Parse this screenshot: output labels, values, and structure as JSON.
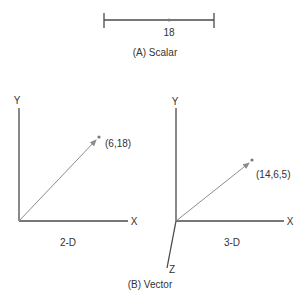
{
  "colors": {
    "axis": "#4a4a4a",
    "vector": "#8c8c8c",
    "point": "#7a7a7a",
    "text": "#333333",
    "background": "#ffffff"
  },
  "scalar": {
    "value_label": "18",
    "caption": "(A) Scalar"
  },
  "vector": {
    "caption": "(B) Vector",
    "two_d": {
      "caption": "2-D",
      "axis_x": "X",
      "axis_y": "Y",
      "point_label": "(6,18)"
    },
    "three_d": {
      "caption": "3-D",
      "axis_x": "X",
      "axis_y": "Y",
      "axis_z": "Z",
      "point_label": "(14,6,5)"
    }
  }
}
